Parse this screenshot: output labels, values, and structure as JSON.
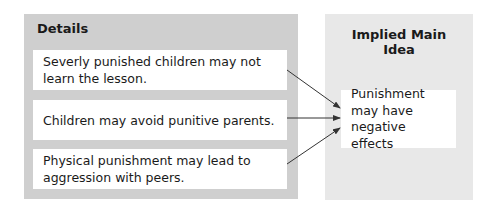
{
  "diagram": {
    "details_panel": {
      "title": "Details",
      "items": [
        {
          "text": "Severly punished children may not learn the lesson."
        },
        {
          "text": "Children may avoid punitive parents."
        },
        {
          "text": "Physical punishment may lead to aggression with peers."
        }
      ]
    },
    "main_idea_panel": {
      "title": "Implied Main Idea",
      "text": "Punishment may have negative effects"
    },
    "colors": {
      "details_panel_bg": "#cfcfcf",
      "main_panel_bg": "#e8e8e8",
      "box_bg": "#ffffff",
      "arrow": "#333333"
    }
  }
}
